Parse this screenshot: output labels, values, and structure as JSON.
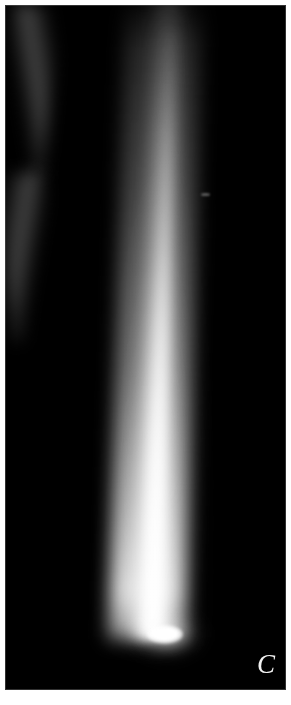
{
  "figure": {
    "panel_label": "C",
    "background_color": "#ffffff",
    "plate_color": "#000000",
    "plume_color": "#ffffff",
    "label_color": "#f2f2f2",
    "plate": {
      "left": 5,
      "top": 5,
      "width": 281,
      "height": 685
    },
    "subject": {
      "source_name": "emission-source-spot",
      "source_x": 160,
      "source_y": 630,
      "plume_name": "luminous-plume",
      "plume_direction": "upward",
      "plume_tilt_degrees": -1.6
    },
    "elements": {
      "plate_name": "photographic-plate",
      "halo_outer_name": "plume-outer-halo",
      "halo_mid_name": "plume-mid-halo",
      "body_name": "plume-body",
      "core_name": "plume-core-filament",
      "lobe_left_name": "plume-left-lobe",
      "lobe_right_name": "plume-right-lobe",
      "grain_name": "film-grain-texture",
      "speck_name": "stray-speck"
    }
  }
}
